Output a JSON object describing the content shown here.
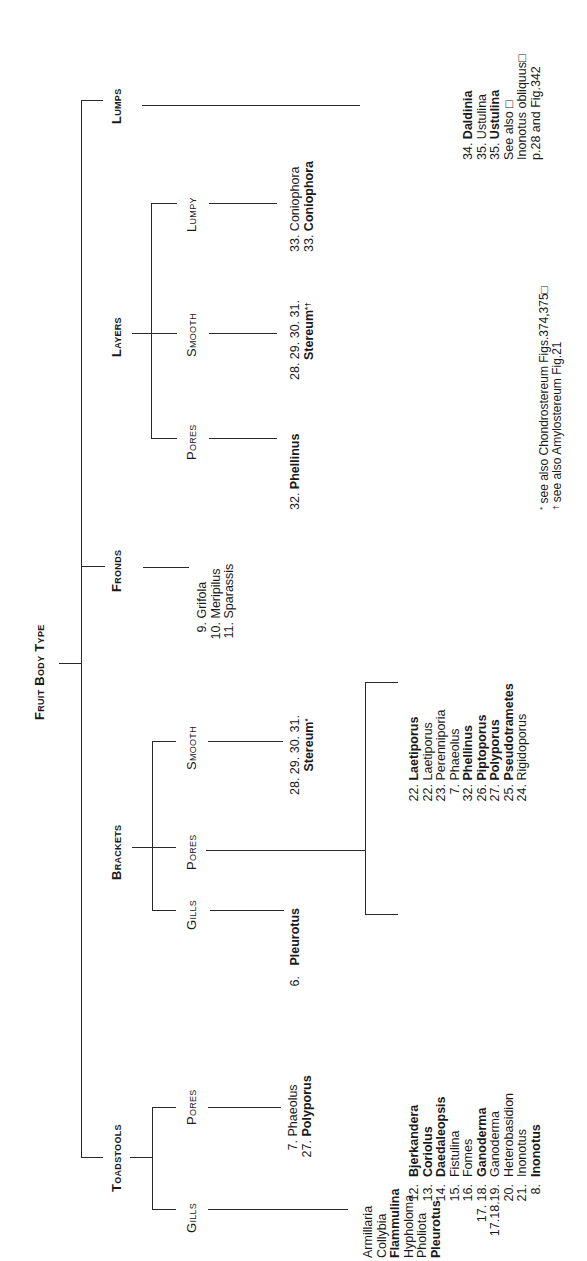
{
  "title": "Fruit Body Type",
  "categories": {
    "toadstools": {
      "label": "Toadstools",
      "gills": {
        "label": "Gills",
        "items": [
          {
            "num": "",
            "name": "Armillaria",
            "bold": false
          },
          {
            "num": "",
            "name": "Collybia",
            "bold": false
          },
          {
            "num": "",
            "name": "Flammulina",
            "bold": true
          },
          {
            "num": "",
            "name": "Hypholoma",
            "bold": false
          },
          {
            "num": "",
            "name": "Pholiota",
            "bold": false
          },
          {
            "num": "",
            "name": "Pleurotus",
            "bold": true
          }
        ]
      },
      "pores": {
        "label": "Pores",
        "items": [
          {
            "num": "7.",
            "name": "Phaeolus",
            "bold": false
          },
          {
            "num": "27.",
            "name": "Polyporus",
            "bold": true
          }
        ]
      }
    },
    "brackets": {
      "label": "Brackets",
      "gills": {
        "label": "Gills",
        "items": [
          {
            "num": "6.",
            "name": "Pleurotus",
            "bold": true
          }
        ]
      },
      "pores": {
        "label": "Pores",
        "group_a": [
          {
            "num": "12.",
            "name": "Bjerkandera",
            "bold": true
          },
          {
            "num": "13.",
            "name": "Coriolus",
            "bold": true
          },
          {
            "num": "14.",
            "name": "Daedaleopsis",
            "bold": true
          },
          {
            "num": "15.",
            "name": "Fistulina",
            "bold": false
          },
          {
            "num": "16.",
            "name": "Fomes",
            "bold": false
          },
          {
            "num": "17. 18.",
            "name": "Ganoderma",
            "bold": true
          },
          {
            "num": "17.18.19.",
            "name": "Ganoderma",
            "bold": false
          },
          {
            "num": "20.",
            "name": "Heterobasidion",
            "bold": false
          },
          {
            "num": "21.",
            "name": "Inonotus",
            "bold": false
          },
          {
            "num": "8.",
            "name": "Inonotus",
            "bold": true
          }
        ],
        "group_b": [
          {
            "num": "22.",
            "name": "Laetiporus",
            "bold": true
          },
          {
            "num": "22.",
            "name": "Laetiporus",
            "bold": false
          },
          {
            "num": "23.",
            "name": "Perenniporia",
            "bold": false
          },
          {
            "num": "7.",
            "name": "Phaeolus",
            "bold": false
          },
          {
            "num": "32.",
            "name": "Phellinus",
            "bold": true
          },
          {
            "num": "26.",
            "name": "Piptoporus",
            "bold": true
          },
          {
            "num": "27.",
            "name": "Polyporus",
            "bold": true
          },
          {
            "num": "25.",
            "name": "Pseudotrametes",
            "bold": true
          },
          {
            "num": "24.",
            "name": "Rigidoporus",
            "bold": false
          }
        ]
      },
      "smooth": {
        "label": "Smooth",
        "nums": "28. 29. 30. 31.",
        "name": "Stereum",
        "mark": "*"
      }
    },
    "fronds": {
      "label": "Fronds",
      "items": [
        {
          "num": "9.",
          "name": "Grifola",
          "bold": false
        },
        {
          "num": "10.",
          "name": "Meripilus",
          "bold": false
        },
        {
          "num": "11.",
          "name": "Sparassis",
          "bold": false
        }
      ]
    },
    "layers": {
      "label": "Layers",
      "pores": {
        "label": "Pores",
        "items": [
          {
            "num": "32.",
            "name": "Phellinus",
            "bold": true
          }
        ]
      },
      "smooth": {
        "label": "Smooth",
        "nums": "28. 29. 30. 31.",
        "name": "Stereum",
        "mark": "*†"
      },
      "lumpy": {
        "label": "Lumpy",
        "items": [
          {
            "num": "33.",
            "name": "Coniophora",
            "bold": false
          },
          {
            "num": "33.",
            "name": "Coniophora",
            "bold": true
          }
        ]
      }
    },
    "lumps": {
      "label": "Lumps",
      "items": [
        {
          "num": "34.",
          "name": "Daldinia",
          "bold": true
        },
        {
          "num": "35.",
          "name": "Ustulina",
          "bold": false
        },
        {
          "num": "35.",
          "name": "Ustulina",
          "bold": true
        }
      ],
      "see_also": [
        "See also □",
        "Inonotus obliquus□",
        "p.28 and Fig.342"
      ]
    }
  },
  "footnotes": [
    {
      "mark": "*",
      "text": "see also Chondrostereum Figs.374,375□"
    },
    {
      "mark": "†",
      "text": "see also Amylostereum Fig.21"
    }
  ]
}
